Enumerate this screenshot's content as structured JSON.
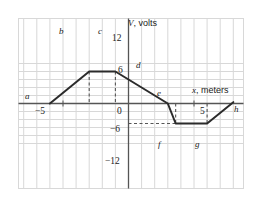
{
  "figure": {
    "name": "potential-vs-position-graph",
    "background": "#ffffff",
    "grid_color": "#d8d8d8",
    "axis_color": "#555555",
    "curve_color": "#2b2b2b",
    "dash_color": "#555555"
  },
  "axes": {
    "y_axis_title": "V, volts",
    "y_axis_title_symbol": "V",
    "y_axis_title_unit": ", volts",
    "x_axis_title": "x, meters",
    "x_axis_title_symbol": "x",
    "x_axis_title_unit": ", meters",
    "x_ticks": [
      {
        "value": -5,
        "label": "−5"
      },
      {
        "value": 0,
        "label": "0"
      },
      {
        "value": 5,
        "label": "5"
      }
    ],
    "y_ticks": [
      {
        "value": 12,
        "label": "12"
      },
      {
        "value": 6,
        "label": "6"
      },
      {
        "value": -6,
        "label": "−6"
      },
      {
        "value": -12,
        "label": "−12"
      }
    ],
    "xlim": [
      -8.5,
      9.5
    ],
    "ylim": [
      -16,
      16
    ],
    "grid": true,
    "grid_step_x": 1,
    "grid_step_y": 3
  },
  "chart_data": {
    "type": "line",
    "title": "",
    "xlabel": "x, meters",
    "ylabel": "V, volts",
    "xlim": [
      -8.5,
      9.5
    ],
    "ylim": [
      -16,
      16
    ],
    "grid": true,
    "legend": "none",
    "points": [
      {
        "id": "a",
        "label": "a",
        "x": -6.0,
        "y": 0.0
      },
      {
        "id": "b",
        "label": "b",
        "x": -3.0,
        "y": 12.0
      },
      {
        "id": "c",
        "label": "c",
        "x": -1.0,
        "y": 12.0
      },
      {
        "id": "d",
        "label": "d",
        "x": 1.0,
        "y": 6.0
      },
      {
        "id": "e",
        "label": "e",
        "x": 3.0,
        "y": 0.0
      },
      {
        "id": "f",
        "label": "f",
        "x": 3.6,
        "y": -7.5
      },
      {
        "id": "g",
        "label": "g",
        "x": 6.0,
        "y": -7.5
      },
      {
        "id": "h",
        "label": "h",
        "x": 8.0,
        "y": 0.5
      }
    ],
    "x": [
      -6.0,
      -3.0,
      -1.0,
      1.0,
      3.0,
      3.6,
      6.0,
      8.0
    ],
    "values": [
      0.0,
      12.0,
      12.0,
      6.0,
      0.0,
      -7.5,
      -7.5,
      0.5
    ],
    "guides": [
      {
        "type": "vertical-dashed",
        "label": "b-guide",
        "x": -3.0,
        "y_from": 12.0,
        "y_to": 0.0
      },
      {
        "type": "vertical-dashed",
        "label": "c-guide",
        "x": -1.0,
        "y_from": 12.0,
        "y_to": 0.0
      },
      {
        "type": "vertical-dashed",
        "label": "e-guide",
        "x": 3.6,
        "y_from": 0.0,
        "y_to": -7.5
      },
      {
        "type": "vertical-dashed",
        "label": "g-guide",
        "x": 6.0,
        "y_from": 0.0,
        "y_to": -7.5
      },
      {
        "type": "horizontal-dashed",
        "label": "f-level",
        "y": -7.5,
        "x_from": 0.0,
        "x_to": 3.6
      }
    ]
  }
}
